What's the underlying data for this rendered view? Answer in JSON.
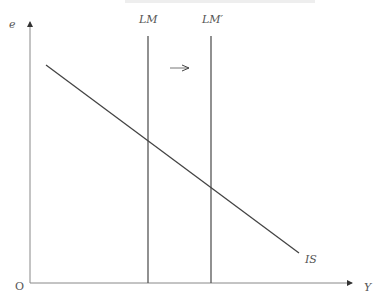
{
  "diagram": {
    "title_fragment": "",
    "axes": {
      "y_label": "e",
      "x_label": "Y",
      "origin_label": "O"
    },
    "curves": [
      {
        "name": "IS",
        "label": "IS",
        "type": "downward-sloping"
      },
      {
        "name": "LM",
        "label": "LM",
        "type": "vertical"
      },
      {
        "name": "LM'",
        "label": "LM′",
        "type": "vertical"
      }
    ],
    "annotation": {
      "shift_arrow": "right",
      "description": "LM shifts right to LM′"
    },
    "colors": {
      "lines": "#444444",
      "axes": "#888888",
      "labels": "#555555"
    }
  }
}
